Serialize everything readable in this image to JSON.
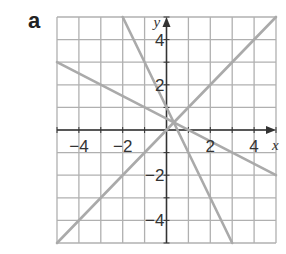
{
  "panel_label": "a",
  "chart_data": {
    "type": "line",
    "title": "",
    "xlabel": "x",
    "ylabel": "y",
    "xlim": [
      -5,
      5
    ],
    "ylim": [
      -5,
      5
    ],
    "grid": true,
    "x_ticks": [
      -4,
      -2,
      2,
      4
    ],
    "y_ticks": [
      4,
      2,
      -2,
      -4
    ],
    "x_tick_labels": [
      "−4",
      "−2",
      "2",
      "4"
    ],
    "y_tick_labels": [
      "4",
      "2",
      "−2",
      "−4"
    ],
    "series": [
      {
        "name": "line 1",
        "equation": "y = -2x + 1",
        "points": [
          [
            -2,
            5
          ],
          [
            3,
            -5
          ]
        ]
      },
      {
        "name": "line 2",
        "equation": "y = -0.5x + 0.5",
        "points": [
          [
            -5,
            3
          ],
          [
            5,
            -2
          ]
        ]
      },
      {
        "name": "line 3",
        "equation": "y = x",
        "points": [
          [
            -5,
            -5
          ],
          [
            5,
            5
          ]
        ]
      }
    ],
    "line_color": "#aaaaaa",
    "grid_color": "#b0b0b0",
    "axis_color": "#333333"
  }
}
